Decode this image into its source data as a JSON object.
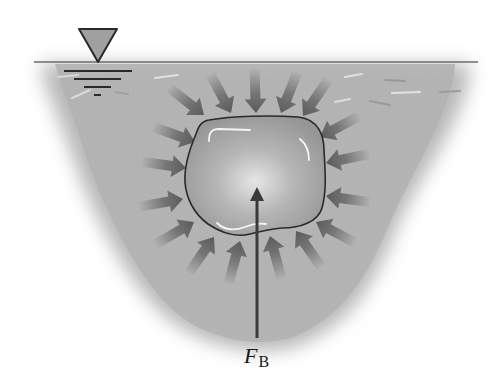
{
  "diagram": {
    "colors": {
      "background": "#ffffff",
      "water": "#b5b5b5",
      "water_surface_line": "#707070",
      "body_fill": "#a8a8a8",
      "body_outline": "#2a2a2a",
      "pressure_arrow": "#6e6e6e",
      "buoyant_arrow": "#3a3a3a",
      "surface_symbol_fill": "#9a9a9a",
      "highlight": "#f2f2f2"
    },
    "surface_symbol": {
      "name": "free-surface-triangle",
      "x": 105,
      "y": 57
    },
    "buoyant_force": {
      "label_main": "F",
      "label_sub": "B",
      "from": [
        257,
        338
      ],
      "to": [
        257,
        188
      ]
    },
    "pressure_arrow_count": 18
  }
}
